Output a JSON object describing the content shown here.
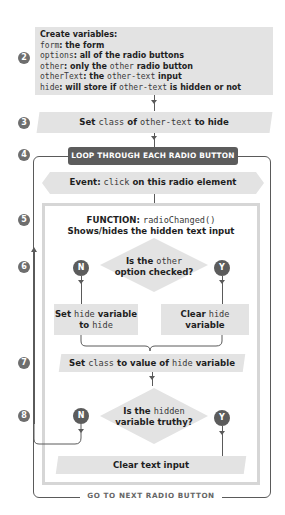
{
  "steps": [
    "2",
    "3",
    "4",
    "5",
    "6",
    "7",
    "8"
  ],
  "create_variables": {
    "title": "Create variables:",
    "lines": [
      {
        "code": "form",
        "text": ": the form"
      },
      {
        "code": "options",
        "text": ": all of the radio buttons"
      },
      {
        "code": "other",
        "text": ": only the ",
        "code2": "other",
        "text2": " radio button"
      },
      {
        "code": "otherText",
        "text": ": the ",
        "code2": "other-text",
        "text2": " input"
      },
      {
        "code": "hide",
        "text": ": will store if ",
        "code2": "other-text",
        "text2": " is hidden or not"
      }
    ]
  },
  "set_class": {
    "pre": "Set ",
    "code": "class",
    "mid": " of ",
    "code2": "other-text",
    "post": " to hide"
  },
  "loop": {
    "label": "LOOP THROUGH EACH RADIO BUTTON",
    "footer": "GO TO NEXT RADIO BUTTON"
  },
  "event": {
    "pre": "Event: ",
    "code": "click",
    "post": " on this radio element"
  },
  "function": {
    "label": "FUNCTION: ",
    "code": "radioChanged()",
    "desc": "Shows/hides the hidden text input"
  },
  "decision1": {
    "line1_pre": "Is the ",
    "line1_code": "other",
    "line2": "option checked?",
    "no": "N",
    "yes": "Y"
  },
  "set_hide": {
    "pre": "Set ",
    "code": "hide",
    "post": " variable",
    "line2_pre": "to ",
    "line2_code": "hide"
  },
  "clear_hide": {
    "pre": "Clear ",
    "code": "hide",
    "line2": "variable"
  },
  "set_class_value": {
    "pre": "Set ",
    "code": "class",
    "mid": " to value of ",
    "code2": "hide",
    "post": " variable"
  },
  "decision2": {
    "line1_pre": "Is the ",
    "line1_code": "hidden",
    "line2": "variable truthy?",
    "no": "N",
    "yes": "Y"
  },
  "clear_text": {
    "label": "Clear text input"
  },
  "colors": {
    "box": "#e3e3e3",
    "badge": "#6e6e6e",
    "loop_header": "#5c5c5c",
    "line": "#5a5a5a"
  }
}
